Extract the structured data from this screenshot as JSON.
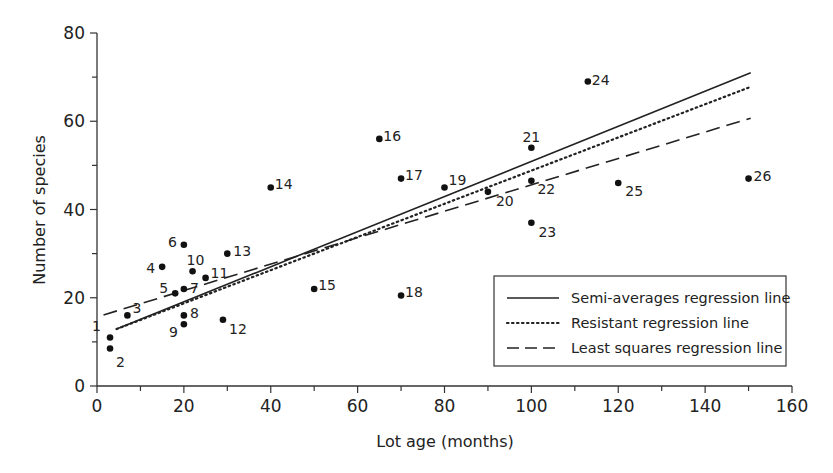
{
  "chart_data": {
    "type": "scatter",
    "title": "",
    "xlabel": "Lot age (months)",
    "ylabel": "Number of species",
    "xlim": [
      0,
      160
    ],
    "ylim": [
      0,
      80
    ],
    "x_ticks": [
      0,
      20,
      40,
      60,
      80,
      100,
      120,
      140,
      160
    ],
    "y_ticks": [
      0,
      20,
      40,
      60,
      80
    ],
    "x_minor_step": 10,
    "y_minor_step": 10,
    "grid": false,
    "legend_position": "lower right",
    "points": [
      {
        "id": "1",
        "x": 3,
        "y": 11
      },
      {
        "id": "2",
        "x": 3,
        "y": 8.5
      },
      {
        "id": "3",
        "x": 7,
        "y": 16
      },
      {
        "id": "4",
        "x": 15,
        "y": 27
      },
      {
        "id": "5",
        "x": 18,
        "y": 21
      },
      {
        "id": "6",
        "x": 20,
        "y": 32
      },
      {
        "id": "7",
        "x": 20,
        "y": 22
      },
      {
        "id": "8",
        "x": 20,
        "y": 16
      },
      {
        "id": "9",
        "x": 20,
        "y": 14
      },
      {
        "id": "10",
        "x": 22,
        "y": 26
      },
      {
        "id": "11",
        "x": 25,
        "y": 24.5
      },
      {
        "id": "12",
        "x": 29,
        "y": 15
      },
      {
        "id": "13",
        "x": 30,
        "y": 30
      },
      {
        "id": "14",
        "x": 40,
        "y": 45
      },
      {
        "id": "15",
        "x": 50,
        "y": 22
      },
      {
        "id": "16",
        "x": 65,
        "y": 56
      },
      {
        "id": "17",
        "x": 70,
        "y": 47
      },
      {
        "id": "18",
        "x": 70,
        "y": 20.5
      },
      {
        "id": "19",
        "x": 80,
        "y": 45
      },
      {
        "id": "20",
        "x": 90,
        "y": 44
      },
      {
        "id": "21",
        "x": 100,
        "y": 54
      },
      {
        "id": "22",
        "x": 100,
        "y": 46.5
      },
      {
        "id": "23",
        "x": 100,
        "y": 37
      },
      {
        "id": "24",
        "x": 113,
        "y": 69
      },
      {
        "id": "25",
        "x": 120,
        "y": 46
      },
      {
        "id": "26",
        "x": 150,
        "y": 47
      }
    ],
    "series": [
      {
        "name": "Semi-averages regression line",
        "style": "solid",
        "x": [
          4.5,
          150.5
        ],
        "y": [
          12.9,
          71
        ]
      },
      {
        "name": "Resistant regression line",
        "style": "dotted",
        "x": [
          4.5,
          150.5
        ],
        "y": [
          12.9,
          67.8
        ]
      },
      {
        "name": "Least squares regression line",
        "style": "dashed",
        "x": [
          1.5,
          150.5
        ],
        "y": [
          16.1,
          60.7
        ]
      }
    ],
    "legend": [
      "Semi-averages regression line",
      "Resistant regression line",
      "Least squares regression line"
    ]
  },
  "label_offsets": {
    "1": [
      -9,
      -10,
      "end"
    ],
    "2": [
      6,
      15,
      "start"
    ],
    "3": [
      5,
      -6,
      "start"
    ],
    "4": [
      -7,
      2,
      "end"
    ],
    "5": [
      -7,
      -4,
      "end"
    ],
    "6": [
      -7,
      -2,
      "end"
    ],
    "7": [
      6,
      0,
      "start"
    ],
    "8": [
      6,
      -1,
      "start"
    ],
    "9": [
      -6,
      9,
      "end"
    ],
    "10": [
      -6,
      -10,
      "start"
    ],
    "11": [
      5,
      -4,
      "start"
    ],
    "12": [
      6,
      10,
      "start"
    ],
    "13": [
      6,
      -2,
      "start"
    ],
    "14": [
      4,
      -2,
      "start"
    ],
    "15": [
      4,
      -3,
      "start"
    ],
    "16": [
      4,
      -2,
      "start"
    ],
    "17": [
      4,
      -3,
      "start"
    ],
    "18": [
      4,
      -3,
      "start"
    ],
    "19": [
      4,
      -6,
      "start"
    ],
    "20": [
      8,
      10,
      "start"
    ],
    "21": [
      -9,
      -10,
      "start"
    ],
    "22": [
      6,
      9,
      "start"
    ],
    "23": [
      7,
      10,
      "start"
    ],
    "24": [
      4,
      -1,
      "start"
    ],
    "25": [
      7,
      9,
      "start"
    ],
    "26": [
      5,
      -2,
      "start"
    ]
  }
}
